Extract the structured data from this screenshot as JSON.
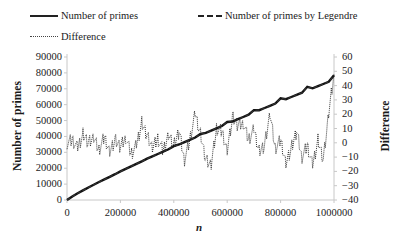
{
  "legend": {
    "primes": "Number of primes",
    "legendre": "Number of primes by Legendre",
    "difference": "Difference"
  },
  "axes": {
    "xlabel": "n",
    "ylabel_left": "Number of primes",
    "ylabel_right": "Difference",
    "x_ticks": [
      "0",
      "200000",
      "400000",
      "600000",
      "800000",
      "1000000"
    ],
    "y_left_ticks": [
      "90000",
      "80000",
      "70000",
      "60000",
      "50000",
      "40000",
      "30000",
      "20000",
      "10000",
      "0"
    ],
    "y_right_ticks": [
      "60",
      "50",
      "40",
      "30",
      "20",
      "10",
      "0",
      "−10",
      "−20",
      "−30",
      "−40"
    ]
  },
  "chart_data": {
    "type": "line",
    "title": "",
    "xlabel": "n",
    "ylabel": "Number of primes",
    "ylabel_secondary": "Difference",
    "xlim": [
      0,
      1000000
    ],
    "ylim": [
      0,
      90000
    ],
    "ylim_secondary": [
      -40,
      60
    ],
    "grid": false,
    "legend_position": "top",
    "x": [
      0,
      20000,
      40000,
      60000,
      80000,
      100000,
      120000,
      140000,
      160000,
      180000,
      200000,
      220000,
      240000,
      260000,
      280000,
      300000,
      320000,
      340000,
      360000,
      380000,
      400000,
      420000,
      440000,
      460000,
      480000,
      500000,
      520000,
      540000,
      560000,
      580000,
      600000,
      620000,
      640000,
      660000,
      680000,
      700000,
      720000,
      740000,
      760000,
      780000,
      800000,
      820000,
      840000,
      860000,
      880000,
      900000,
      920000,
      940000,
      960000,
      980000,
      1000000
    ],
    "series": [
      {
        "name": "Number of primes",
        "axis": "left",
        "style": "solid",
        "values": [
          0,
          2262,
          4203,
          6057,
          7837,
          9592,
          11301,
          12986,
          14629,
          16262,
          17984,
          19552,
          21151,
          22727,
          24295,
          25997,
          27417,
          28935,
          30447,
          31925,
          33860,
          34933,
          36419,
          37887,
          39336,
          41538,
          42242,
          43684,
          45127,
          46565,
          49098,
          49429,
          50845,
          52260,
          53675,
          56543,
          56497,
          57893,
          59285,
          60681,
          63951,
          63426,
          64807,
          66187,
          67552,
          71274,
          70317,
          71674,
          73031,
          74387,
          78498
        ]
      },
      {
        "name": "Number of primes by Legendre",
        "axis": "left",
        "style": "dashed",
        "values": [
          0,
          2260,
          4200,
          6050,
          7830,
          9585,
          11295,
          12980,
          14625,
          16255,
          17980,
          19545,
          21145,
          22720,
          24290,
          25990,
          27410,
          28930,
          30440,
          31920,
          33855,
          34925,
          36410,
          37880,
          39330,
          41530,
          42235,
          43675,
          45120,
          46560,
          49090,
          49420,
          50840,
          52255,
          53670,
          56535,
          56490,
          57885,
          59280,
          60675,
          63945,
          63420,
          64800,
          66180,
          67545,
          71270,
          70310,
          71665,
          73025,
          74380,
          78490
        ]
      },
      {
        "name": "Difference",
        "axis": "right",
        "style": "dotted",
        "values": [
          0,
          2,
          -4,
          6,
          0,
          3,
          -5,
          4,
          -6,
          2,
          -3,
          4,
          -8,
          -2,
          14,
          5,
          -4,
          3,
          -6,
          6,
          -2,
          8,
          -12,
          2,
          20,
          6,
          -12,
          -16,
          10,
          8,
          -5,
          18,
          12,
          14,
          2,
          9,
          -6,
          -2,
          20,
          -4,
          2,
          -14,
          -4,
          8,
          -10,
          -2,
          -16,
          2,
          -12,
          20,
          48
        ]
      }
    ]
  }
}
